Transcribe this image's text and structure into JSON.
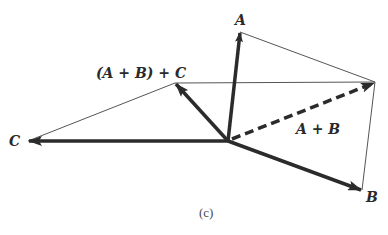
{
  "diagram": {
    "caption": "(c)",
    "colors": {
      "vector": "#2b2b2b",
      "thin_line": "#555555",
      "background": "#ffffff"
    },
    "origin": {
      "x": 228,
      "y": 141
    },
    "vectors": [
      {
        "id": "A",
        "label": "A",
        "from": [
          228,
          141
        ],
        "to": [
          240,
          32
        ],
        "style": "solid-bold"
      },
      {
        "id": "B",
        "label": "B",
        "from": [
          228,
          141
        ],
        "to": [
          362,
          190
        ],
        "style": "solid-bold"
      },
      {
        "id": "C",
        "label": "C",
        "from": [
          228,
          141
        ],
        "to": [
          28,
          141
        ],
        "style": "solid-bold"
      },
      {
        "id": "A+B",
        "label": "A + B",
        "from": [
          228,
          141
        ],
        "to": [
          375,
          82
        ],
        "style": "dashed-bold"
      },
      {
        "id": "(A+B)+C",
        "label": "(A + B) + C",
        "from": [
          228,
          141
        ],
        "to": [
          175,
          83
        ],
        "style": "solid-bold"
      }
    ],
    "construction_lines": [
      {
        "from": [
          240,
          32
        ],
        "to": [
          375,
          82
        ]
      },
      {
        "from": [
          362,
          190
        ],
        "to": [
          375,
          82
        ]
      },
      {
        "from": [
          375,
          82
        ],
        "to": [
          175,
          83
        ]
      },
      {
        "from": [
          175,
          83
        ],
        "to": [
          28,
          141
        ]
      }
    ],
    "labels": {
      "A": "A",
      "B": "B",
      "C": "C",
      "A_plus_B": "A + B",
      "A_plus_B_plus_C": "(A + B) + C"
    }
  }
}
